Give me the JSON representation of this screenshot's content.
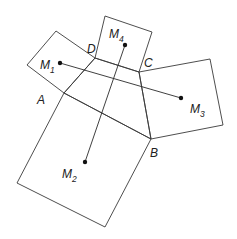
{
  "diagram": {
    "vertices": {
      "A": {
        "label": "A",
        "x": 64,
        "y": 93
      },
      "B": {
        "label": "B",
        "x": 151,
        "y": 139
      },
      "C": {
        "label": "C",
        "x": 139,
        "y": 72
      },
      "D": {
        "label": "D",
        "x": 95,
        "y": 58
      }
    },
    "squares": [
      {
        "name": "square-on-AD",
        "points": "64,93 95,58 56,31 27,65"
      },
      {
        "name": "square-on-AB",
        "points": "64,93 151,139 105,227 17,183"
      },
      {
        "name": "square-on-BC",
        "points": "151,139 139,72 210,59 223,125"
      },
      {
        "name": "square-on-CD",
        "points": "139,72 95,58 105,16 152,32"
      }
    ],
    "quadrilateral": "64,93 151,139 139,72 95,58",
    "centers": {
      "M1": {
        "main": "M",
        "sub": "1",
        "x": 60,
        "y": 63
      },
      "M2": {
        "main": "M",
        "sub": "2",
        "x": 85,
        "y": 162
      },
      "M3": {
        "main": "M",
        "sub": "3",
        "x": 181,
        "y": 98
      },
      "M4": {
        "main": "M",
        "sub": "4",
        "x": 125,
        "y": 45
      }
    },
    "segments": [
      {
        "name": "segment-M1-M3",
        "from": "M1",
        "to": "M3"
      },
      {
        "name": "segment-M4-M2",
        "from": "M4",
        "to": "M2"
      }
    ]
  }
}
